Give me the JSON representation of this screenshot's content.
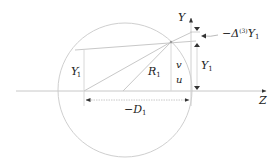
{
  "diagram": {
    "colors": {
      "line": "#c8c8c8",
      "text": "#222222",
      "arrow": "#333333"
    },
    "labels": {
      "y_axis": "Y",
      "z_axis": "Z",
      "delta_prefix": "−Δ",
      "delta_sup": "(3)",
      "delta_var": "Y",
      "delta_sub": "1",
      "y1_var": "Y",
      "y1_sub": "1",
      "y1p_var": "Y",
      "y1p_sup": "′",
      "y1p_sub": "1",
      "r1_var": "R",
      "r1_sub": "1",
      "d1_prefix": "−D",
      "d1_sub": "1",
      "v": "v",
      "u": "u"
    }
  }
}
